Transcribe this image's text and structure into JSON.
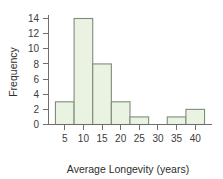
{
  "chart_data": {
    "type": "bar",
    "title": "",
    "subtitle": "",
    "xlabel": "Average Longevity (years)",
    "ylabel": "Frequency",
    "xlim": [
      0.5,
      44.5
    ],
    "ylim": [
      0,
      14.8
    ],
    "grid": false,
    "legend_position": "none",
    "bin_width": 5,
    "bin_edges": [
      2.5,
      7.5,
      12.5,
      17.5,
      22.5,
      27.5,
      32.5,
      37.5,
      42.5
    ],
    "categories": [
      "2.5-7.5",
      "7.5-12.5",
      "12.5-17.5",
      "17.5-22.5",
      "22.5-27.5",
      "27.5-32.5",
      "32.5-37.5",
      "37.5-42.5"
    ],
    "values": [
      3,
      14,
      8,
      3,
      1,
      0,
      1,
      2
    ],
    "bin_centers": [
      5,
      10,
      15,
      20,
      25,
      30,
      35,
      40
    ],
    "xticks": [
      5,
      10,
      15,
      20,
      25,
      30,
      35,
      40
    ],
    "xtick_labels": [
      "5",
      "10",
      "15",
      "20",
      "25",
      "30",
      "35",
      "40"
    ],
    "yticks": [
      0,
      2,
      4,
      6,
      8,
      10,
      12,
      14
    ],
    "ytick_labels": [
      "0",
      "2",
      "4",
      "6",
      "8",
      "10",
      "12",
      "14"
    ],
    "colors": {
      "bar_fill": "#eaf3e1",
      "bar_stroke": "#7d8c7d",
      "axis": "#6f6f6f",
      "text": "#2e2e2e",
      "background": "#ffffff"
    }
  }
}
